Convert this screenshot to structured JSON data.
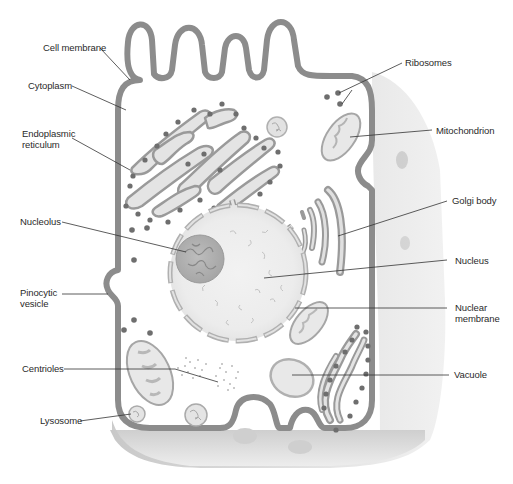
{
  "diagram": {
    "colors": {
      "membrane": "#8c8c8c",
      "cell_fill": "#ffffff",
      "shadow_side": "#d4d4d4",
      "organelle_fill": "#e6e6e6",
      "organelle_stroke": "#9a9a9a",
      "ribosome": "#6e6e6e",
      "leader_line": "#333333",
      "label_text": "#2a2a2a"
    },
    "labels_left": [
      {
        "id": "cell-membrane",
        "lines": [
          "Cell membrane"
        ]
      },
      {
        "id": "cytoplasm",
        "lines": [
          "Cytoplasm"
        ]
      },
      {
        "id": "endoplasmic-reticulum",
        "lines": [
          "Endoplasmic",
          "reticulum"
        ]
      },
      {
        "id": "nucleolus",
        "lines": [
          "Nucleolus"
        ]
      },
      {
        "id": "pinocytic-vesicle",
        "lines": [
          "Pinocytic",
          "vesicle"
        ]
      },
      {
        "id": "centrioles",
        "lines": [
          "Centrioles"
        ]
      },
      {
        "id": "lysosome",
        "lines": [
          "Lysosome"
        ]
      }
    ],
    "labels_right": [
      {
        "id": "ribosomes",
        "lines": [
          "Ribosomes"
        ]
      },
      {
        "id": "mitochondrion",
        "lines": [
          "Mitochondrion"
        ]
      },
      {
        "id": "golgi-body",
        "lines": [
          "Golgi body"
        ]
      },
      {
        "id": "nucleus",
        "lines": [
          "Nucleus"
        ]
      },
      {
        "id": "nuclear-membrane",
        "lines": [
          "Nuclear",
          "membrane"
        ]
      },
      {
        "id": "vacuole",
        "lines": [
          "Vacuole"
        ]
      }
    ]
  }
}
